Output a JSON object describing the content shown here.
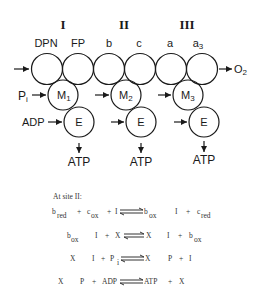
{
  "diagram": {
    "sites": [
      {
        "label": "I",
        "x": 63
      },
      {
        "label": "II",
        "x": 124
      },
      {
        "label": "III",
        "x": 187
      }
    ],
    "carriers": [
      {
        "label": "DPN",
        "x": 46
      },
      {
        "label": "FP",
        "x": 78
      },
      {
        "label": "b",
        "x": 109
      },
      {
        "label": "c",
        "x": 139
      },
      {
        "label": "a",
        "x": 170
      },
      {
        "label": "a",
        "sub": "3",
        "x": 200
      }
    ],
    "output": {
      "label": "O",
      "sub": "2"
    },
    "inputs": {
      "pi": "P",
      "pi_sub": "i",
      "adp": "ADP"
    },
    "m_circles": [
      {
        "label": "M",
        "sub": "1"
      },
      {
        "label": "M",
        "sub": "2"
      },
      {
        "label": "M",
        "sub": "3"
      }
    ],
    "e_label": "E",
    "atp_label": "ATP"
  },
  "equations": {
    "heading": "At site II:",
    "eq1": {
      "b": "b",
      "b_sub": "red",
      "plus1": "+",
      "c": "c",
      "c_sub": "ox",
      "plus2": "+",
      "i": "I",
      "r_b": "b",
      "r_b_sub": "ox",
      "r_i": "I",
      "r_plus": "+",
      "r_c": "c",
      "r_c_sub": "red"
    },
    "eq2": {
      "b": "b",
      "b_sub": "ox",
      "i": "I",
      "plus": "+",
      "x": "X",
      "r_x": "X",
      "r_i": "I",
      "r_plus": "+",
      "r_b": "b",
      "r_b_sub": "ox"
    },
    "eq3": {
      "x": "X",
      "i": "I",
      "plus": "+",
      "p": "P",
      "p_sub": "i",
      "r_x": "X",
      "r_p": "P",
      "r_plus": "+",
      "r_i": "I"
    },
    "eq4": {
      "x": "X",
      "p": "P",
      "plus": "+",
      "adp": "ADP",
      "r_atp": "ATP",
      "r_plus": "+",
      "r_x": "X"
    }
  }
}
